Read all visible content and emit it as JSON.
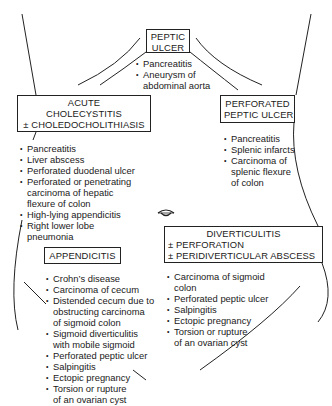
{
  "regions": {
    "peptic_ulcer": {
      "title": [
        "PEPTIC",
        "ULCER"
      ],
      "differentials": [
        "Pancreatitis",
        "Aneurysm of\nabdominal aorta"
      ]
    },
    "acute_cholecystitis": {
      "title": [
        "ACUTE",
        "CHOLECYSTITIS",
        "± CHOLEDOCHOLITHIASIS"
      ],
      "differentials": [
        "Pancreatitis",
        "Liver abscess",
        "Perforated duodenal ulcer",
        "Perforated or penetrating\ncarcinoma of hepatic\nflexure of colon",
        "High-lying appendicitis",
        "Right lower lobe\npneumonia"
      ]
    },
    "perforated_peptic_ulcer": {
      "title": [
        "PERFORATED",
        "PEPTIC ULCER"
      ],
      "differentials": [
        "Pancreatitis",
        "Splenic infarcts",
        "Carcinoma of\nsplenic flexure\nof colon"
      ]
    },
    "appendicitis": {
      "title": [
        "APPENDICITIS"
      ],
      "differentials": [
        "Crohn’s disease",
        "Carcinoma of cecum",
        "Distended cecum due to\nobstructing carcinoma\nof sigmoid colon",
        "Sigmoid diverticulitis\nwith mobile sigmoid",
        "Perforated peptic ulcer",
        "Salpingitis",
        "Ectopic pregnancy",
        "Torsion or rupture\nof an ovarian cyst"
      ]
    },
    "diverticulitis": {
      "title": [
        "DIVERTICULITIS",
        "± PERFORATION",
        "± PERIDIVERTICULAR ABSCESS"
      ],
      "differentials": [
        "Carcinoma of sigmoid\ncolon",
        "Perforated peptic ulcer",
        "Salpingitis",
        "Ectopic pregnancy",
        "Torsion or rupture\nof an ovarian cyst"
      ]
    }
  },
  "landmarks": {
    "navel_icon": "umbilicus-icon"
  },
  "colors": {
    "ink": "#1a1a1a",
    "background": "#ffffff"
  }
}
